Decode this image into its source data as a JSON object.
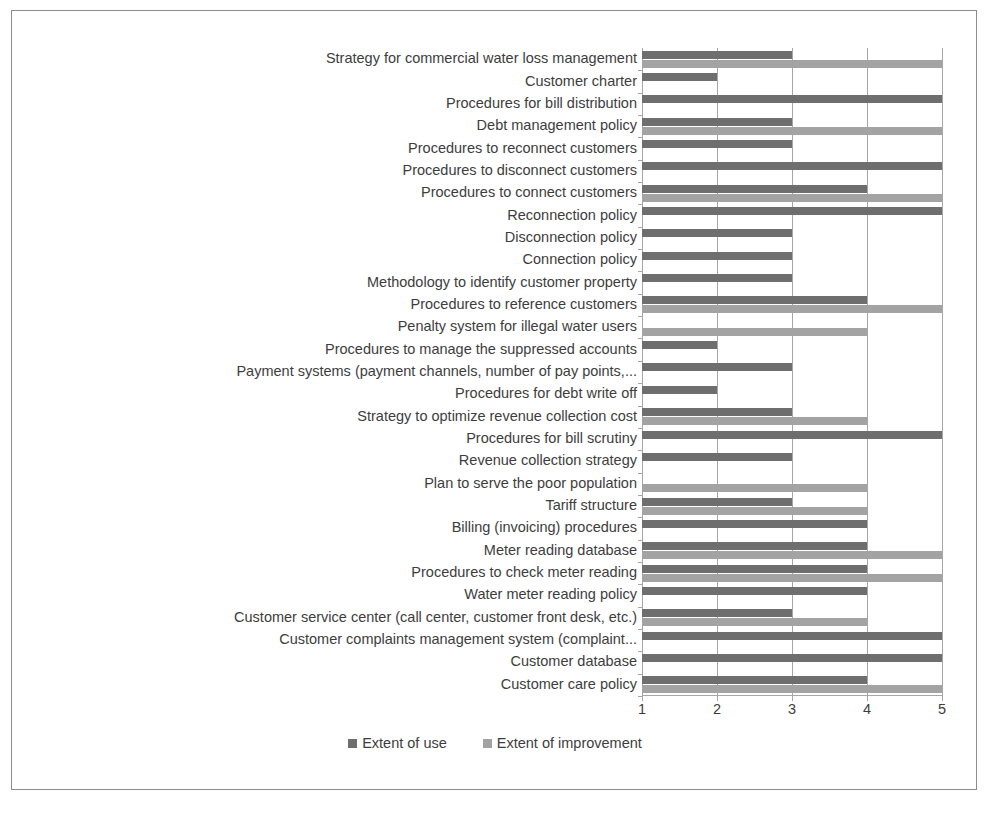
{
  "chart_data": {
    "type": "bar",
    "orientation": "horizontal",
    "title": "",
    "xlabel": "",
    "ylabel": "",
    "xlim": [
      1,
      5
    ],
    "xticks": [
      1,
      2,
      3,
      4,
      5
    ],
    "grid": true,
    "legend_position": "bottom",
    "colors": {
      "use": "#6e6e6e",
      "improve": "#a3a3a3",
      "gridline": "#a6a6a6",
      "text": "#3d3d3d",
      "frame": "#8c8c8c",
      "background": "#ffffff"
    },
    "categories": [
      "Strategy for commercial water loss management",
      "Customer charter",
      "Procedures for bill distribution",
      "Debt management policy",
      "Procedures to reconnect customers",
      "Procedures to disconnect customers",
      "Procedures to connect customers",
      "Reconnection policy",
      "Disconnection policy",
      "Connection policy",
      "Methodology to identify customer property",
      "Procedures to reference customers",
      "Penalty system  for illegal water users",
      "Procedures to manage the suppressed accounts",
      "Payment systems (payment channels, number of pay points,...",
      "Procedures for debt write off",
      "Strategy to optimize revenue collection cost",
      "Procedures for bill scrutiny",
      "Revenue collection strategy",
      "Plan to serve the poor population",
      "Tariff structure",
      "Billing (invoicing) procedures",
      "Meter reading database",
      "Procedures to check meter reading",
      "Water meter reading policy",
      "Customer service center (call center, customer front desk, etc.)",
      "Customer complaints management system (complaint...",
      "Customer database",
      "Customer care policy"
    ],
    "series": [
      {
        "name": "Extent of use",
        "color": "#6e6e6e",
        "values": [
          3,
          2,
          5,
          3,
          3,
          5,
          4,
          5,
          3,
          3,
          3,
          4,
          1,
          2,
          3,
          2,
          3,
          5,
          3,
          1,
          3,
          4,
          4,
          4,
          4,
          3,
          5,
          5,
          4
        ]
      },
      {
        "name": "Extent of improvement",
        "color": "#a3a3a3",
        "values": [
          5,
          1,
          1,
          5,
          1,
          1,
          5,
          1,
          1,
          1,
          1,
          5,
          4,
          1,
          1,
          1,
          4,
          1,
          1,
          4,
          4,
          1,
          5,
          5,
          1,
          4,
          1,
          1,
          5
        ]
      }
    ]
  },
  "legend": {
    "items": [
      {
        "label": "Extent of use"
      },
      {
        "label": "Extent of improvement"
      }
    ]
  }
}
